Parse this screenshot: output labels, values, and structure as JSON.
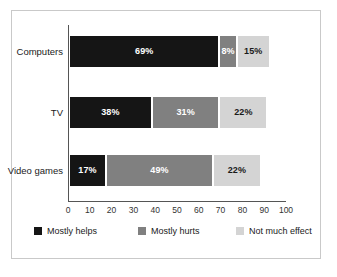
{
  "chart_data": {
    "type": "bar",
    "orientation": "horizontal",
    "stacked": true,
    "title": "",
    "subtitle": "",
    "xlabel": "",
    "ylabel": "",
    "xlim": [
      0,
      100
    ],
    "xticks": [
      "0",
      "10",
      "20",
      "30",
      "40",
      "50",
      "60",
      "70",
      "80",
      "90",
      "100"
    ],
    "xtick_values": [
      0,
      10,
      20,
      30,
      40,
      50,
      60,
      70,
      80,
      90,
      100
    ],
    "grid": false,
    "legend_position": "bottom",
    "categories": [
      "Computers",
      "TV",
      "Video games"
    ],
    "series": [
      {
        "name": "Mostly helps",
        "color": "#151515",
        "values": [
          69,
          38,
          17
        ],
        "labels": [
          "69%",
          "38%",
          "17%"
        ]
      },
      {
        "name": "Mostly hurts",
        "color": "#808080",
        "values": [
          8,
          31,
          49
        ],
        "labels": [
          "8%",
          "31%",
          "22%"
        ]
      },
      {
        "name": "Not much effect",
        "color": "#d4d4d4",
        "values": [
          15,
          22,
          22
        ],
        "labels": [
          "15%",
          "22%",
          "22%"
        ]
      }
    ],
    "rows": [
      {
        "category": "Computers",
        "segments": [
          {
            "series": "Mostly helps",
            "value": 69,
            "label": "69%",
            "color": "#151515"
          },
          {
            "series": "Mostly hurts",
            "value": 8,
            "label": "8%",
            "color": "#808080"
          },
          {
            "series": "Not much effect",
            "value": 15,
            "label": "15%",
            "color": "#d4d4d4"
          }
        ]
      },
      {
        "category": "TV",
        "segments": [
          {
            "series": "Mostly helps",
            "value": 38,
            "label": "38%",
            "color": "#151515"
          },
          {
            "series": "Mostly hurts",
            "value": 31,
            "label": "31%",
            "color": "#808080"
          },
          {
            "series": "Not much effect",
            "value": 22,
            "label": "22%",
            "color": "#d4d4d4"
          }
        ]
      },
      {
        "category": "Video games",
        "segments": [
          {
            "series": "Mostly helps",
            "value": 17,
            "label": "17%",
            "color": "#151515"
          },
          {
            "series": "Mostly hurts",
            "value": 49,
            "label": "49%",
            "color": "#808080"
          },
          {
            "series": "Not much effect",
            "value": 22,
            "label": "22%",
            "color": "#d4d4d4"
          }
        ]
      }
    ]
  },
  "legend": {
    "items": [
      {
        "label": "Mostly helps",
        "color": "#151515"
      },
      {
        "label": "Mostly hurts",
        "color": "#808080"
      },
      {
        "label": "Not much effect",
        "color": "#d4d4d4"
      }
    ]
  },
  "colors": {
    "mostly_helps": "#151515",
    "mostly_hurts": "#808080",
    "not_much_effect": "#d4d4d4",
    "axis": "#555555",
    "frame": "#c9c9c9",
    "background": "#ffffff"
  }
}
